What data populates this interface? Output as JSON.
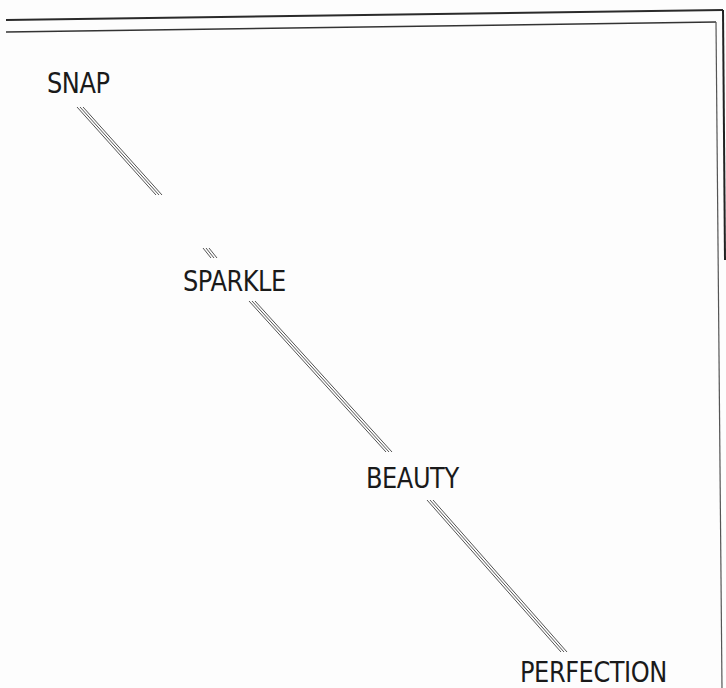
{
  "document": {
    "words": [
      {
        "id": "snap",
        "text": "SNAP"
      },
      {
        "id": "sparkle",
        "text": "SPARKLE"
      },
      {
        "id": "beauty",
        "text": "BEAUTY"
      },
      {
        "id": "perfection",
        "text": "PERFECTION"
      }
    ],
    "colors": {
      "ink": "#1a1a1a",
      "line": "#555555",
      "paper": "#fdfdfd"
    }
  }
}
